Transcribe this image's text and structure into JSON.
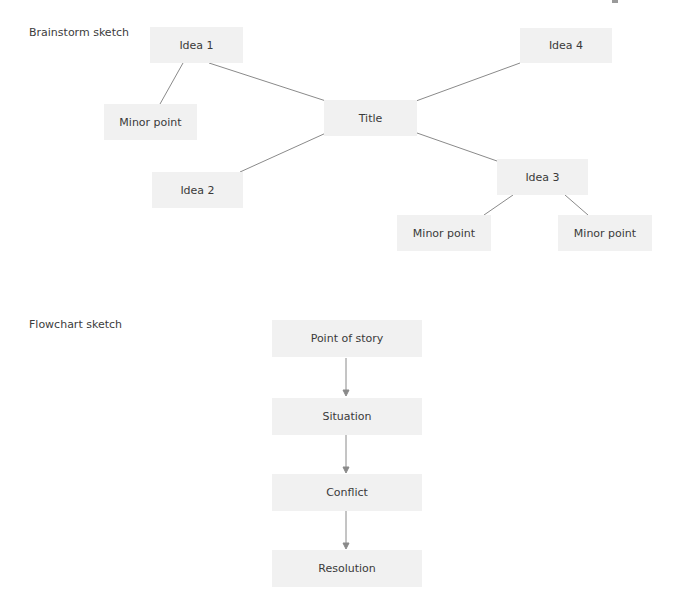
{
  "brainstorm": {
    "label": "Brainstorm sketch",
    "nodes": {
      "title": "Title",
      "idea1": "Idea 1",
      "idea2": "Idea 2",
      "idea3": "Idea 3",
      "idea4": "Idea 4",
      "idea1_minor": "Minor point",
      "idea3_minor_left": "Minor point",
      "idea3_minor_right": "Minor point"
    }
  },
  "flowchart": {
    "label": "Flowchart sketch",
    "steps": [
      "Point of story",
      "Situation",
      "Conflict",
      "Resolution"
    ]
  },
  "colors": {
    "node_fill": "#f1f1f1",
    "line": "#8a8a8a",
    "text": "#3a3a3a"
  }
}
